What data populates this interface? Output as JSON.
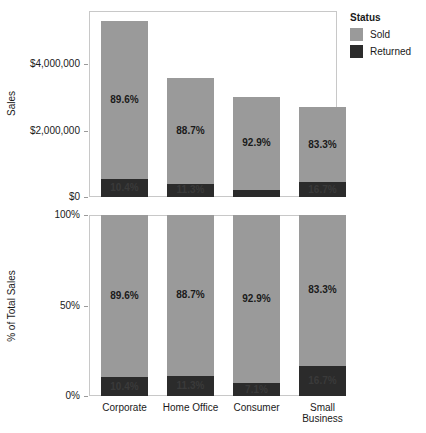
{
  "chart_data": {
    "type": "bar",
    "title": "",
    "subtitle": "",
    "categories": [
      "Corporate",
      "Home Office",
      "Consumer",
      "Small Business"
    ],
    "legend": {
      "title": "Status",
      "position": "right",
      "entries": [
        {
          "name": "Sold",
          "color": "#9a9a9a"
        },
        {
          "name": "Returned",
          "color": "#2b2b2b"
        }
      ]
    },
    "panels": [
      {
        "id": "sales",
        "ylabel": "Sales",
        "ytick_labels": [
          "$0",
          "$2,000,000",
          "$4,000,000"
        ],
        "ytick_values": [
          0,
          2000000,
          4000000
        ],
        "ylim": [
          0,
          5600000
        ],
        "grid": false,
        "stacked": true,
        "series": [
          {
            "name": "Sold",
            "color": "#9a9a9a",
            "values": [
              4750000,
              3166000,
              2805000,
              2250000
            ]
          },
          {
            "name": "Returned",
            "color": "#2b2b2b",
            "values": [
              551000,
              403000,
              214000,
              451000
            ]
          }
        ],
        "totals": [
          5301000,
          3569000,
          3019000,
          2701000
        ],
        "bar_labels": {
          "Sold": [
            "89.6%",
            "88.7%",
            "92.9%",
            "83.3%"
          ],
          "Returned": [
            "10.4%",
            "11.3%",
            "7.1%",
            "16.7%"
          ]
        }
      },
      {
        "id": "percent-of-total",
        "ylabel": "% of Total Sales",
        "ytick_labels": [
          "0%",
          "50%",
          "100%"
        ],
        "ytick_values": [
          0,
          50,
          100
        ],
        "ylim": [
          0,
          100
        ],
        "grid": false,
        "stacked": true,
        "series": [
          {
            "name": "Sold",
            "color": "#9a9a9a",
            "values": [
              89.6,
              88.7,
              92.9,
              83.3
            ]
          },
          {
            "name": "Returned",
            "color": "#2b2b2b",
            "values": [
              10.4,
              11.3,
              7.1,
              16.7
            ]
          }
        ],
        "bar_labels": {
          "Sold": [
            "89.6%",
            "88.7%",
            "92.9%",
            "83.3%"
          ],
          "Returned": [
            "10.4%",
            "11.3%",
            "7.1%",
            "16.7%"
          ]
        }
      }
    ]
  }
}
